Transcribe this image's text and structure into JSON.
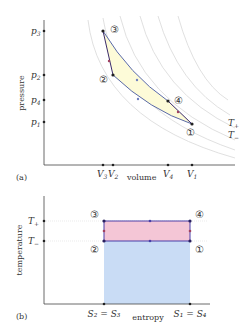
{
  "panel_a": {
    "caption": "(a)",
    "ylabel": "pressure",
    "xlabel": "volume",
    "yticks": [
      {
        "label": "p",
        "sub": "3",
        "y": 31
      },
      {
        "label": "p",
        "sub": "2",
        "y": 75
      },
      {
        "label": "p",
        "sub": "4",
        "y": 100
      },
      {
        "label": "p",
        "sub": "1",
        "y": 122
      }
    ],
    "xticks": [
      {
        "label": "V",
        "sub": "3",
        "x": 103
      },
      {
        "label": "V",
        "sub": "2",
        "x": 113
      },
      {
        "label": "V",
        "sub": "4",
        "x": 168
      },
      {
        "label": "V",
        "sub": "1",
        "x": 192
      }
    ],
    "points": [
      {
        "label": "①",
        "x": 192,
        "y": 124
      },
      {
        "label": "②",
        "x": 113,
        "y": 75
      },
      {
        "label": "③",
        "x": 103,
        "y": 31
      },
      {
        "label": "④",
        "x": 168,
        "y": 101
      }
    ],
    "isotherm_labels": [
      {
        "label": "T",
        "sub": "+"
      },
      {
        "label": "T",
        "sub": "−"
      }
    ]
  },
  "panel_b": {
    "caption": "(b)",
    "ylabel": "temperature",
    "xlabel": "entropy",
    "yticks": [
      {
        "label": "T",
        "sub": "+"
      },
      {
        "label": "T",
        "sub": "−"
      }
    ],
    "xticks": [
      {
        "label": "S₂ = S₃"
      },
      {
        "label": "S₁ = S₄"
      }
    ],
    "points": [
      {
        "label": "①"
      },
      {
        "label": "②"
      },
      {
        "label": "③"
      },
      {
        "label": "④"
      }
    ],
    "colors": {
      "work_area": "#f4c6d6",
      "heat_area": "#c9dcf5",
      "cycle_line": "#4a3fa8",
      "pv_fill": "#fdfbd8"
    }
  }
}
